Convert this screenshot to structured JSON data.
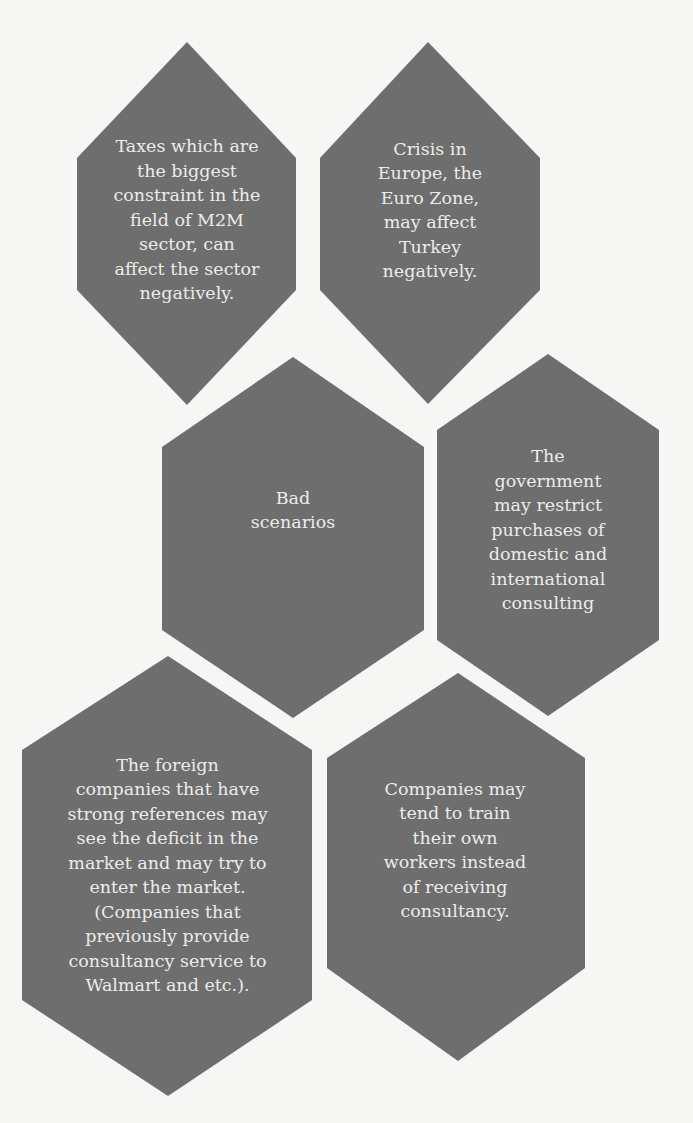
{
  "diagram": {
    "type": "hexagon-cluster",
    "colors": {
      "background": "#f6f6f4",
      "hex_fill": "#6e6e6e",
      "text": "#ececea"
    },
    "center": {
      "id": "bad-scenarios",
      "label": "Bad\nscenarios"
    },
    "nodes": [
      {
        "id": "taxes",
        "label": "Taxes which are\nthe biggest\nconstraint in the\nfield of M2M\nsector, can\naffect the sector\nnegatively."
      },
      {
        "id": "crisis-europe",
        "label": "Crisis in\nEurope, the\nEuro Zone,\nmay affect\nTurkey\nnegatively."
      },
      {
        "id": "government-restrict",
        "label": "The\ngovernment\nmay restrict\npurchases of\ndomestic and\ninternational\nconsulting"
      },
      {
        "id": "foreign-companies",
        "label": "The foreign\ncompanies that have\nstrong references may\nsee the deficit in the\nmarket and may try to\nenter the market.\n(Companies that\npreviously provide\nconsultancy service to\nWalmart and etc.)."
      },
      {
        "id": "train-own-workers",
        "label": "Companies may\ntend to train\ntheir own\nworkers instead\nof receiving\nconsultancy."
      }
    ]
  }
}
